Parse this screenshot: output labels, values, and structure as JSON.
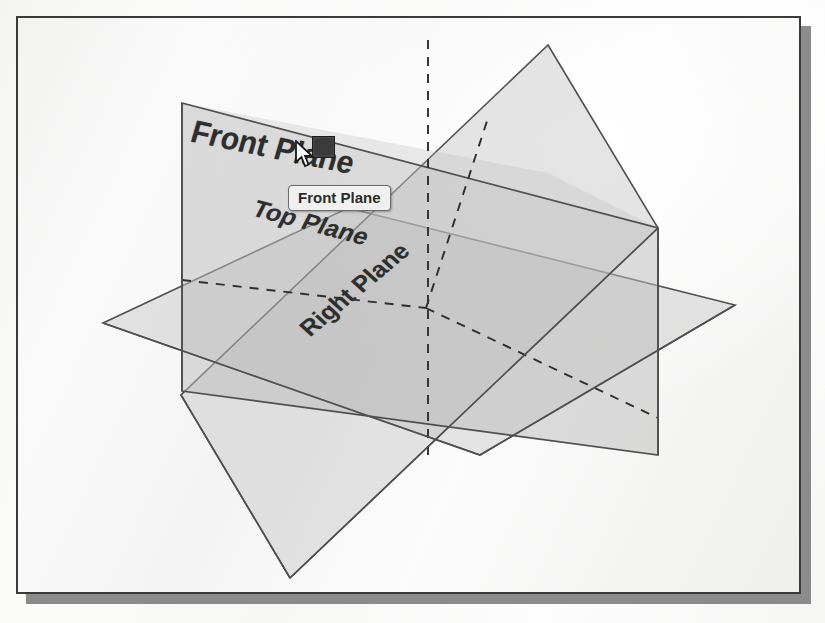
{
  "app": {
    "name": "SolidWorks graphics area",
    "view": "Isometric reference planes"
  },
  "viewport": {
    "background_light": "#fbfbfa",
    "background_dark": "#efefee",
    "border_color": "#3a3a3a",
    "shadow_color": "#8b8b8b"
  },
  "planes": {
    "front": {
      "label": "Front Plane",
      "fill": "#bdbdbd",
      "stroke": "#4a4a4a",
      "opacity": 0.55
    },
    "top": {
      "label": "Top Plane",
      "fill": "#c4c4c4",
      "stroke": "#4a4a4a",
      "opacity": 0.45
    },
    "right": {
      "label": "Right Plane",
      "fill": "#bfbfbf",
      "stroke": "#4a4a4a",
      "opacity": 0.5
    }
  },
  "tooltip": {
    "text": "Front Plane",
    "background": "#f0f0ee",
    "border_color": "#6d6d6d"
  },
  "selection": {
    "handle_color": "#3b3b3b",
    "handle_label": "selected-plane-handle"
  },
  "cursor": {
    "type": "arrow-pointer"
  },
  "ghost_text": {
    "block_1": "the three default\nreference planes\nare shown in the\nisometric view",
    "block_2": "the FeatureManager\ndesign tree lists\nthe planes"
  }
}
